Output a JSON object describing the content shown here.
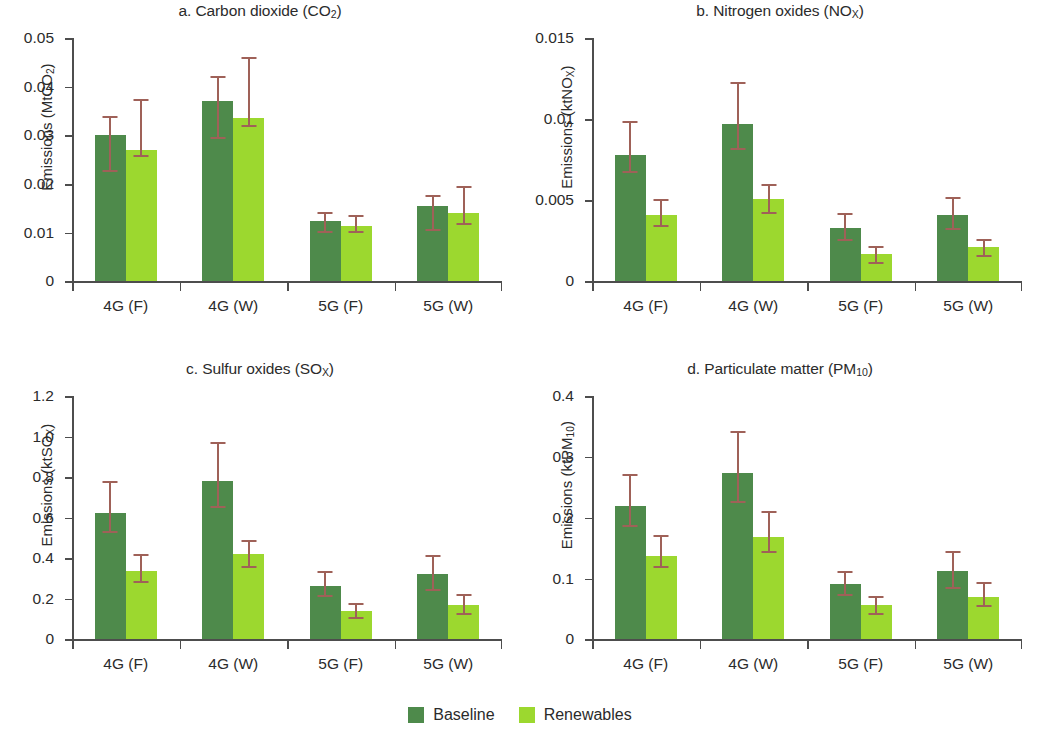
{
  "figure": {
    "background": "#ffffff",
    "baseline_color": "#4e8a4b",
    "renewables_color": "#9cd82f",
    "errorbar_color": "#9f6158",
    "axis_color": "#4d4d4d"
  },
  "legend": {
    "position": "bottom-center",
    "items": [
      {
        "label": "Baseline",
        "color": "#4e8a4b"
      },
      {
        "label": "Renewables",
        "color": "#9cd82f"
      }
    ]
  },
  "chart_data": [
    {
      "id": "a",
      "type": "bar",
      "title": "a. Carbon dioxide (CO2)",
      "title_parts": {
        "prefix": "a. Carbon dioxide (CO",
        "sub": "2",
        "suffix": ")"
      },
      "xlabel": "",
      "ylabel": "Emissions (MtCO2)",
      "ylabel_parts": {
        "prefix": "Emissions (MtCO",
        "sub": "2",
        "suffix": ")"
      },
      "ylim": [
        0,
        0.05
      ],
      "yticks": [
        0,
        0.01,
        0.02,
        0.03,
        0.04,
        0.05
      ],
      "ytick_labels": [
        "0",
        "0.01",
        "0.02",
        "0.03",
        "0.04",
        "0.05"
      ],
      "grid": false,
      "categories": [
        "4G (F)",
        "4G (W)",
        "5G (F)",
        "5G (W)"
      ],
      "series": [
        {
          "name": "Baseline",
          "color": "#4e8a4b",
          "values": [
            0.03,
            0.037,
            0.0125,
            0.0155
          ],
          "err_low": [
            0.0228,
            0.0296,
            0.0104,
            0.0108
          ],
          "err_high": [
            0.034,
            0.0422,
            0.0143,
            0.0178
          ]
        },
        {
          "name": "Renewables",
          "color": "#9cd82f",
          "values": [
            0.027,
            0.0335,
            0.0113,
            0.014
          ],
          "err_low": [
            0.0259,
            0.0322,
            0.0104,
            0.0121
          ],
          "err_high": [
            0.0375,
            0.0461,
            0.0137,
            0.0197
          ]
        }
      ]
    },
    {
      "id": "b",
      "type": "bar",
      "title": "b. Nitrogen oxides (NOX)",
      "title_parts": {
        "prefix": "b. Nitrogen oxides (NO",
        "sub": "X",
        "suffix": ")"
      },
      "xlabel": "",
      "ylabel": "Emissions (ktNOX)",
      "ylabel_parts": {
        "prefix": "Emissions (ktNO",
        "sub": "X",
        "suffix": ")"
      },
      "ylim": [
        0,
        0.015
      ],
      "yticks": [
        0,
        0.005,
        0.01,
        0.015
      ],
      "ytick_labels": [
        "0",
        "0.005",
        "0.01",
        "0.015"
      ],
      "grid": false,
      "categories": [
        "4G (F)",
        "4G (W)",
        "5G (F)",
        "5G (W)"
      ],
      "series": [
        {
          "name": "Baseline",
          "color": "#4e8a4b",
          "values": [
            0.0078,
            0.0097,
            0.0033,
            0.0041
          ],
          "err_low": [
            0.0068,
            0.0082,
            0.0026,
            0.0033
          ],
          "err_high": [
            0.0099,
            0.0123,
            0.0042,
            0.0052
          ]
        },
        {
          "name": "Renewables",
          "color": "#9cd82f",
          "values": [
            0.0041,
            0.0051,
            0.0017,
            0.0021
          ],
          "err_low": [
            0.0035,
            0.0043,
            0.0012,
            0.0016
          ],
          "err_high": [
            0.0051,
            0.006,
            0.0022,
            0.0026
          ]
        }
      ]
    },
    {
      "id": "c",
      "type": "bar",
      "title": "c. Sulfur oxides (SOX)",
      "title_parts": {
        "prefix": "c. Sulfur oxides (SO",
        "sub": "X",
        "suffix": ")"
      },
      "xlabel": "",
      "ylabel": "Emissions (ktSOX)",
      "ylabel_parts": {
        "prefix": "Emissions (ktSO",
        "sub": "X",
        "suffix": ")"
      },
      "ylim": [
        0,
        1.2
      ],
      "yticks": [
        0,
        0.2,
        0.4,
        0.6,
        0.8,
        1.0,
        1.2
      ],
      "ytick_labels": [
        "0",
        "0.2",
        "0.4",
        "0.6",
        "0.8",
        "1.0",
        "1.2"
      ],
      "grid": false,
      "categories": [
        "4G (F)",
        "4G (W)",
        "5G (F)",
        "5G (W)"
      ],
      "series": [
        {
          "name": "Baseline",
          "color": "#4e8a4b",
          "values": [
            0.625,
            0.78,
            0.262,
            0.325
          ],
          "err_low": [
            0.535,
            0.66,
            0.218,
            0.25
          ],
          "err_high": [
            0.78,
            0.975,
            0.335,
            0.418
          ]
        },
        {
          "name": "Renewables",
          "color": "#9cd82f",
          "values": [
            0.335,
            0.42,
            0.138,
            0.17
          ],
          "err_low": [
            0.29,
            0.36,
            0.112,
            0.13
          ],
          "err_high": [
            0.42,
            0.49,
            0.178,
            0.225
          ]
        }
      ]
    },
    {
      "id": "d",
      "type": "bar",
      "title": "d. Particulate matter (PM10)",
      "title_parts": {
        "prefix": "d. Particulate matter (PM",
        "sub": "10",
        "suffix": ")"
      },
      "xlabel": "",
      "ylabel": "Emissions (ktPM10)",
      "ylabel_parts": {
        "prefix": "Emissions (ktPM",
        "sub": "10",
        "suffix": ")"
      },
      "ylim": [
        0,
        0.4
      ],
      "yticks": [
        0,
        0.1,
        0.2,
        0.3,
        0.4
      ],
      "ytick_labels": [
        "0",
        "0.1",
        "0.2",
        "0.3",
        "0.4"
      ],
      "grid": false,
      "categories": [
        "4G (F)",
        "4G (W)",
        "5G (F)",
        "5G (W)"
      ],
      "series": [
        {
          "name": "Baseline",
          "color": "#4e8a4b",
          "values": [
            0.22,
            0.273,
            0.091,
            0.113
          ],
          "err_low": [
            0.188,
            0.228,
            0.074,
            0.086
          ],
          "err_high": [
            0.272,
            0.342,
            0.113,
            0.145
          ]
        },
        {
          "name": "Renewables",
          "color": "#9cd82f",
          "values": [
            0.137,
            0.169,
            0.056,
            0.069
          ],
          "err_low": [
            0.12,
            0.146,
            0.044,
            0.056
          ],
          "err_high": [
            0.171,
            0.211,
            0.072,
            0.094
          ]
        }
      ]
    }
  ]
}
